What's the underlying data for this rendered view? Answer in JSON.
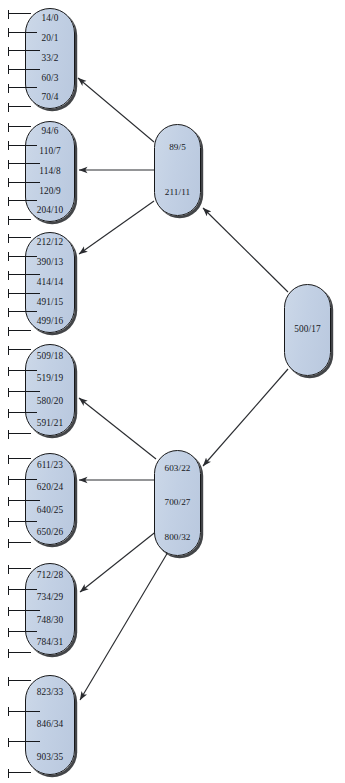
{
  "diagram": {
    "type": "tree",
    "node_fill_color": "#c2d0e4",
    "node_border_color": "#17181a",
    "edge_color": "#2a2c30",
    "background_color": "#ffffff"
  },
  "nodes": [
    {
      "id": "root",
      "kind": "root",
      "entries": [
        "500/17"
      ],
      "x": 284,
      "y": 284,
      "w": 47,
      "h": 92,
      "ticks": 0
    },
    {
      "id": "internal-upper",
      "kind": "internal",
      "entries": [
        "89/5",
        "211/11"
      ],
      "x": 154,
      "y": 124,
      "w": 47,
      "h": 92,
      "ticks": 0
    },
    {
      "id": "internal-lower",
      "kind": "internal",
      "entries": [
        "603/22",
        "700/27",
        "800/32"
      ],
      "x": 154,
      "y": 450,
      "w": 47,
      "h": 106,
      "ticks": 0
    },
    {
      "id": "leaf-1",
      "kind": "leaf",
      "entries": [
        "14/0",
        "20/1",
        "33/2",
        "60/3",
        "70/4"
      ],
      "x": 25,
      "y": 8,
      "w": 50,
      "h": 101,
      "ticks": 6
    },
    {
      "id": "leaf-2",
      "kind": "leaf",
      "entries": [
        "94/6",
        "110/7",
        "114/8",
        "120/9",
        "204/10"
      ],
      "x": 25,
      "y": 121,
      "w": 50,
      "h": 101,
      "ticks": 6
    },
    {
      "id": "leaf-3",
      "kind": "leaf",
      "entries": [
        "212/12",
        "390/13",
        "414/14",
        "491/15",
        "499/16"
      ],
      "x": 25,
      "y": 232,
      "w": 50,
      "h": 101,
      "ticks": 6
    },
    {
      "id": "leaf-4",
      "kind": "leaf",
      "entries": [
        "509/18",
        "519/19",
        "580/20",
        "591/21"
      ],
      "x": 25,
      "y": 344,
      "w": 50,
      "h": 92,
      "ticks": 5
    },
    {
      "id": "leaf-5",
      "kind": "leaf",
      "entries": [
        "611/23",
        "620/24",
        "640/25",
        "650/26"
      ],
      "x": 25,
      "y": 453,
      "w": 50,
      "h": 92,
      "ticks": 5
    },
    {
      "id": "leaf-6",
      "kind": "leaf",
      "entries": [
        "712/28",
        "734/29",
        "748/30",
        "784/31"
      ],
      "x": 25,
      "y": 563,
      "w": 50,
      "h": 92,
      "ticks": 5
    },
    {
      "id": "leaf-7",
      "kind": "leaf",
      "entries": [
        "823/33",
        "846/34",
        "903/35"
      ],
      "x": 25,
      "y": 675,
      "w": 50,
      "h": 100,
      "ticks": 4
    }
  ],
  "edges": [
    {
      "id": "edge-root-to-upper",
      "from": "root",
      "to": "internal-upper",
      "x1": 288,
      "y1": 292,
      "x2": 203,
      "y2": 208
    },
    {
      "id": "edge-root-to-lower",
      "from": "root",
      "to": "internal-lower",
      "x1": 288,
      "y1": 369,
      "x2": 203,
      "y2": 466
    },
    {
      "id": "edge-upper-to-leaf1",
      "from": "internal-upper",
      "to": "leaf-1",
      "x1": 154,
      "y1": 142,
      "x2": 78,
      "y2": 78
    },
    {
      "id": "edge-upper-to-leaf2",
      "from": "internal-upper",
      "to": "leaf-2",
      "x1": 154,
      "y1": 170,
      "x2": 79,
      "y2": 170
    },
    {
      "id": "edge-upper-to-leaf3",
      "from": "internal-upper",
      "to": "leaf-3",
      "x1": 154,
      "y1": 201,
      "x2": 79,
      "y2": 254
    },
    {
      "id": "edge-lower-to-leaf4",
      "from": "internal-lower",
      "to": "leaf-4",
      "x1": 156,
      "y1": 459,
      "x2": 79,
      "y2": 398
    },
    {
      "id": "edge-lower-to-leaf5",
      "from": "internal-lower",
      "to": "leaf-5",
      "x1": 154,
      "y1": 480,
      "x2": 79,
      "y2": 480
    },
    {
      "id": "edge-lower-to-leaf6",
      "from": "internal-lower",
      "to": "leaf-6",
      "x1": 158,
      "y1": 530,
      "x2": 80,
      "y2": 592
    },
    {
      "id": "edge-lower-to-leaf7",
      "from": "internal-lower",
      "to": "leaf-7",
      "x1": 168,
      "y1": 552,
      "x2": 80,
      "y2": 700
    }
  ]
}
